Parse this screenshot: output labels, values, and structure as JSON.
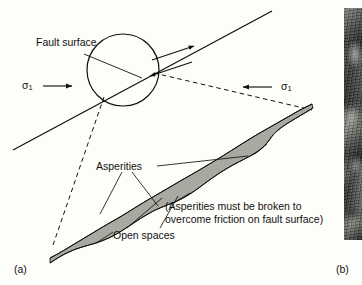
{
  "figure": {
    "background_color": "#fdfdfa",
    "line_color": "#111111",
    "asperity_fill_color": "#a9a9a1"
  },
  "panels": [
    {
      "id": "a",
      "letter": "(a)",
      "type": "line-diagram"
    },
    {
      "id": "b",
      "letter": "(b)",
      "type": "photograph"
    }
  ],
  "diagram": {
    "labels": {
      "fault_surface": "Fault surface",
      "asperities": "Asperities",
      "open_spaces": "Open spaces",
      "note_line1": "(Asperities must be broken to",
      "note_line2": "overcome friction on fault surface)",
      "stress_left": "σ",
      "stress_left_sub": "1",
      "stress_right": "σ",
      "stress_right_sub": "1"
    },
    "icons": {
      "stress_arrow_left": "arrow-right-icon",
      "stress_arrow_right": "arrow-left-icon",
      "shear_arrow_upper": "shear-arrow-up-right-icon",
      "shear_arrow_lower": "shear-arrow-down-left-icon"
    }
  },
  "photograph": {
    "description": "rock-outcrop-photo",
    "letter": "(b)"
  }
}
